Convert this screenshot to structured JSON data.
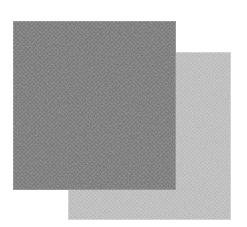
{
  "canvas": {
    "width": 247,
    "height": 227,
    "background_color": "#ffffff",
    "title": "Two overlapping textured gray squares"
  },
  "shapes": [
    {
      "id": "square-light",
      "name": "light-gray-square",
      "label": "Light gray square",
      "fill_color": "#b4b4b4",
      "edge_color": "#c6c6c6",
      "x": 68,
      "y": 52,
      "width": 163,
      "height": 168,
      "z": 1,
      "texture": "fine-noise-halftone"
    },
    {
      "id": "square-dark",
      "name": "dark-gray-square",
      "label": "Dark gray square",
      "fill_color": "#6e6e6e",
      "edge_color": "#808080",
      "x": 13,
      "y": 21,
      "width": 163,
      "height": 169,
      "z": 2,
      "texture": "fine-noise-halftone"
    }
  ]
}
